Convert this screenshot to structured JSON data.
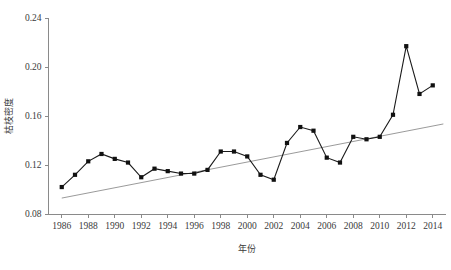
{
  "chart_data": {
    "type": "line",
    "title": "",
    "subtitle": "",
    "xlabel": "年份",
    "ylabel": "枯枝密度",
    "xlim": [
      1985,
      2015
    ],
    "ylim": [
      0.08,
      0.24
    ],
    "grid": false,
    "legend": null,
    "x_ticks": [
      "1986",
      "1988",
      "1990",
      "1992",
      "1994",
      "1996",
      "1998",
      "2000",
      "2002",
      "2004",
      "2006",
      "2008",
      "2010",
      "2012",
      "2014"
    ],
    "x_tick_values": [
      1986,
      1988,
      1990,
      1992,
      1994,
      1996,
      1998,
      2000,
      2002,
      2004,
      2006,
      2008,
      2010,
      2012,
      2014
    ],
    "y_ticks": [
      "0.08",
      "0.12",
      "0.16",
      "0.20",
      "0.24"
    ],
    "y_tick_values": [
      0.08,
      0.12,
      0.16,
      0.2,
      0.24
    ],
    "x": [
      1986,
      1987,
      1988,
      1989,
      1990,
      1991,
      1992,
      1993,
      1994,
      1995,
      1996,
      1997,
      1998,
      1999,
      2000,
      2001,
      2002,
      2003,
      2004,
      2005,
      2006,
      2007,
      2008,
      2009,
      2010,
      2011,
      2012,
      2013,
      2014
    ],
    "series": [
      {
        "name": "枯枝密度",
        "marker": "square",
        "color": "#111111",
        "values": [
          0.102,
          0.112,
          0.123,
          0.129,
          0.125,
          0.122,
          0.11,
          0.117,
          0.115,
          0.113,
          0.113,
          0.116,
          0.131,
          0.131,
          0.127,
          0.112,
          0.108,
          0.138,
          0.151,
          0.148,
          0.126,
          0.122,
          0.143,
          0.141,
          0.143,
          0.161,
          0.217,
          0.178,
          0.185
        ]
      },
      {
        "name": "线性趋势线",
        "type": "trend",
        "color": "#8e8e8e",
        "endpoints": [
          {
            "x": 1986,
            "y": 0.093
          },
          {
            "x": 2014.8,
            "y": 0.1535
          }
        ]
      }
    ]
  },
  "axes": {
    "y_axis_label": "枯枝密度",
    "x_axis_label": "年份"
  }
}
